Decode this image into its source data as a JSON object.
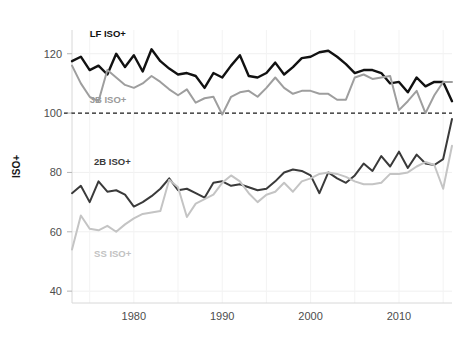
{
  "chart_data": {
    "type": "line",
    "title": "",
    "xlabel": "",
    "ylabel": "ISO+",
    "xlim": [
      1973,
      2016
    ],
    "ylim": [
      36,
      128
    ],
    "xticks": [
      1980,
      1990,
      2000,
      2010
    ],
    "yticks": [
      40,
      60,
      80,
      100,
      120
    ],
    "grid": true,
    "legend_position": "inline-annotations",
    "reference_line": {
      "y": 100,
      "style": "dashed",
      "color": "#1a1a1a"
    },
    "x": [
      1973,
      1974,
      1975,
      1976,
      1977,
      1978,
      1979,
      1980,
      1981,
      1982,
      1983,
      1984,
      1985,
      1986,
      1987,
      1988,
      1989,
      1990,
      1991,
      1992,
      1993,
      1994,
      1995,
      1996,
      1997,
      1998,
      1999,
      2000,
      2001,
      2002,
      2003,
      2004,
      2005,
      2006,
      2007,
      2008,
      2009,
      2010,
      2011,
      2012,
      2013,
      2014,
      2015,
      2016
    ],
    "series": [
      {
        "name": "LF ISO+",
        "color": "#111111",
        "label_x": 1975.0,
        "label_y": 125.5,
        "values": [
          117.5,
          119.0,
          114.5,
          116.0,
          113.0,
          120.0,
          115.5,
          119.5,
          114.0,
          121.5,
          117.5,
          115.0,
          113.0,
          113.5,
          112.5,
          108.5,
          113.5,
          112.0,
          116.0,
          119.5,
          112.5,
          112.0,
          113.5,
          117.0,
          113.0,
          115.5,
          118.5,
          119.0,
          120.5,
          121.0,
          119.0,
          116.5,
          113.5,
          114.5,
          114.5,
          113.5,
          110.0,
          110.5,
          107.0,
          112.0,
          109.0,
          110.5,
          110.5,
          104.0
        ]
      },
      {
        "name": "3B ISO+",
        "color": "#9e9e9e",
        "label_x": 1975.0,
        "label_y": 103.5,
        "values": [
          116.0,
          110.0,
          105.5,
          104.0,
          114.5,
          112.0,
          109.5,
          108.5,
          110.0,
          112.5,
          110.5,
          108.0,
          106.0,
          108.0,
          103.5,
          105.0,
          105.5,
          99.5,
          105.5,
          107.0,
          107.5,
          105.5,
          108.5,
          112.0,
          108.5,
          106.5,
          107.5,
          107.5,
          106.5,
          106.5,
          104.5,
          104.5,
          112.0,
          113.0,
          111.5,
          112.0,
          112.5,
          101.0,
          104.0,
          107.5,
          100.0,
          106.0,
          110.5,
          110.5
        ]
      },
      {
        "name": "2B ISO+",
        "color": "#3a3a3a",
        "label_x": 1975.5,
        "label_y": 82.5,
        "values": [
          73.0,
          75.5,
          70.0,
          77.0,
          73.5,
          74.0,
          72.5,
          68.5,
          70.0,
          72.0,
          74.5,
          78.0,
          74.0,
          74.5,
          73.0,
          71.5,
          76.5,
          77.0,
          75.5,
          76.0,
          75.0,
          74.0,
          74.5,
          77.0,
          80.0,
          81.0,
          80.5,
          79.0,
          73.0,
          80.0,
          78.0,
          76.5,
          79.0,
          83.0,
          80.5,
          85.5,
          82.0,
          87.0,
          81.5,
          86.0,
          83.0,
          82.5,
          84.5,
          98.0
        ]
      },
      {
        "name": "SS ISO+",
        "color": "#c4c4c4",
        "label_x": 1975.5,
        "label_y": 51.5,
        "values": [
          54.0,
          65.5,
          61.0,
          60.5,
          62.0,
          60.0,
          62.5,
          64.5,
          66.0,
          66.5,
          67.0,
          77.5,
          75.0,
          65.0,
          69.5,
          71.0,
          72.5,
          76.5,
          79.0,
          77.0,
          73.0,
          70.0,
          72.5,
          73.5,
          76.5,
          73.5,
          77.0,
          78.0,
          79.5,
          80.0,
          79.5,
          78.5,
          77.0,
          76.0,
          76.0,
          76.5,
          79.5,
          79.5,
          80.0,
          82.0,
          83.5,
          82.5,
          74.5,
          89.0
        ]
      }
    ]
  }
}
